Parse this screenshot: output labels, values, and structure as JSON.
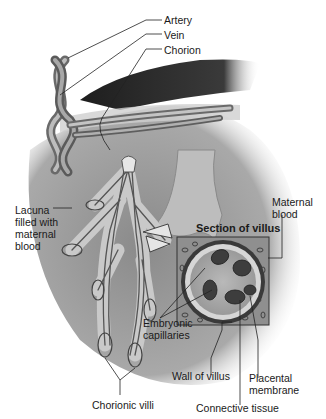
{
  "figure": {
    "palette": {
      "background": "#ffffff",
      "tissue": "#8c8c8c",
      "dark_tissue": "#2e2e2e",
      "vessel": "#9a9a9a",
      "line": "#222222"
    }
  },
  "labels": {
    "artery": "Artery",
    "vein": "Vein",
    "chorion": "Chorion",
    "lacuna": "Lacuna\nfilled with\nmaternal\nblood",
    "maternal_blood": "Maternal\nblood",
    "section_of_villus": "Section of villus",
    "embryonic_capillaries": "Embryonic\ncapillaries",
    "wall_of_villus": "Wall of villus",
    "placental_membrane": "Placental\nmembrane",
    "connective_tissue": "Connective tissue",
    "chorionic_villi": "Chorionic villi"
  }
}
